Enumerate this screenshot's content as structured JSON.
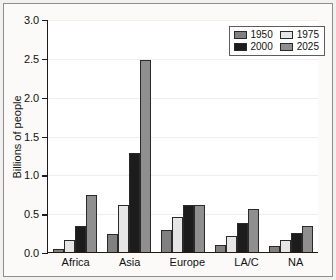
{
  "chart_data": {
    "type": "bar",
    "title": "",
    "xlabel": "",
    "ylabel": "Billions of people",
    "categories": [
      "Africa",
      "Asia",
      "Europe",
      "LA/C",
      "NA"
    ],
    "series": [
      {
        "name": "1950",
        "color": "#808080",
        "values": [
          0.04,
          0.23,
          0.28,
          0.09,
          0.08
        ]
      },
      {
        "name": "1975",
        "color": "#e6e6e6",
        "values": [
          0.15,
          0.6,
          0.45,
          0.21,
          0.15
        ]
      },
      {
        "name": "2000",
        "color": "#1c1c1c",
        "values": [
          0.33,
          1.28,
          0.6,
          0.37,
          0.24
        ]
      },
      {
        "name": "2025",
        "color": "#8f8f8f",
        "values": [
          0.74,
          2.47,
          0.6,
          0.56,
          0.33
        ]
      }
    ],
    "ylim": [
      0.0,
      3.0
    ],
    "ytick_values": [
      0.0,
      0.5,
      1.0,
      1.5,
      2.0,
      2.5,
      3.0
    ],
    "ytick_labels": [
      "0.0",
      "0.5",
      "1.0",
      "1.5",
      "2.0",
      "2.5",
      "3.0"
    ],
    "grid": true,
    "legend_position": "top-right",
    "legend_entries": [
      "1950",
      "1975",
      "2000",
      "2025"
    ]
  },
  "colors": {
    "axis": "#1b1b1b",
    "grid": "#f0eeeb",
    "page_background": "#f2f1ef",
    "plot_background": "#ffffff",
    "frame_border": "#8e8d8a"
  }
}
